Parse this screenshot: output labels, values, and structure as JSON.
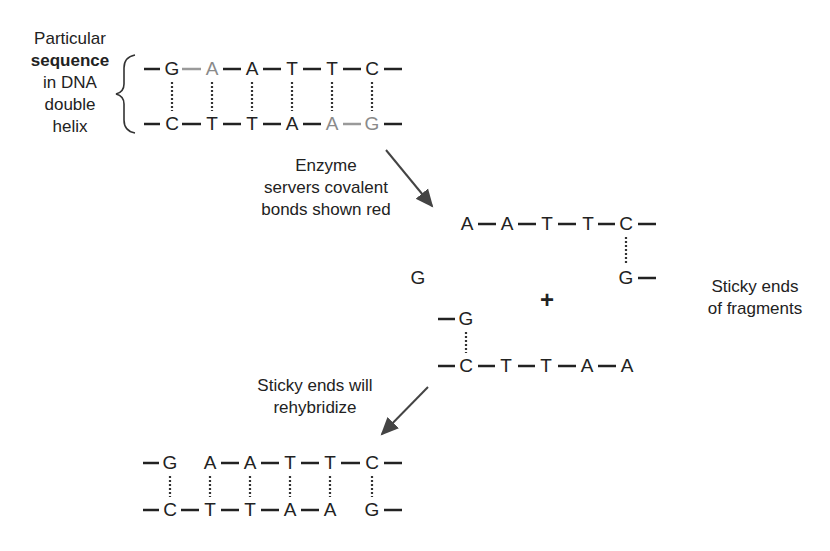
{
  "diagram": {
    "labels": {
      "sequence": [
        "Particular",
        "sequence",
        "in DNA",
        "double",
        "helix"
      ],
      "enzyme": [
        "Enzyme",
        "servers covalent",
        "bonds shown red"
      ],
      "sticky_ends": [
        "Sticky ends",
        "of fragments"
      ],
      "rehybridize": [
        "Sticky ends will",
        "rehybridize"
      ],
      "plus": "+"
    },
    "original_duplex": {
      "top_strand": [
        "G",
        "A",
        "A",
        "T",
        "T",
        "C"
      ],
      "bottom_strand": [
        "C",
        "T",
        "T",
        "A",
        "A",
        "G"
      ],
      "cut_bonds": "G–A (top), A–G (bottom)"
    },
    "fragment_right": {
      "top_strand": [
        "A",
        "A",
        "T",
        "T",
        "C"
      ],
      "bottom_strand": [
        "G"
      ]
    },
    "fragment_left": {
      "lone_top": "G",
      "top_strand": [
        "G"
      ],
      "bottom_strand": [
        "C",
        "T",
        "T",
        "A",
        "A"
      ]
    },
    "lone_G": "G",
    "rehybridized_duplex": {
      "top_strand": [
        "G",
        "A",
        "A",
        "T",
        "T",
        "C"
      ],
      "bottom_strand": [
        "C",
        "T",
        "T",
        "A",
        "A",
        "G"
      ]
    },
    "colors": {
      "ink": "#222222",
      "cut_bond": "#8a8a8a",
      "arrow": "#444444"
    }
  }
}
